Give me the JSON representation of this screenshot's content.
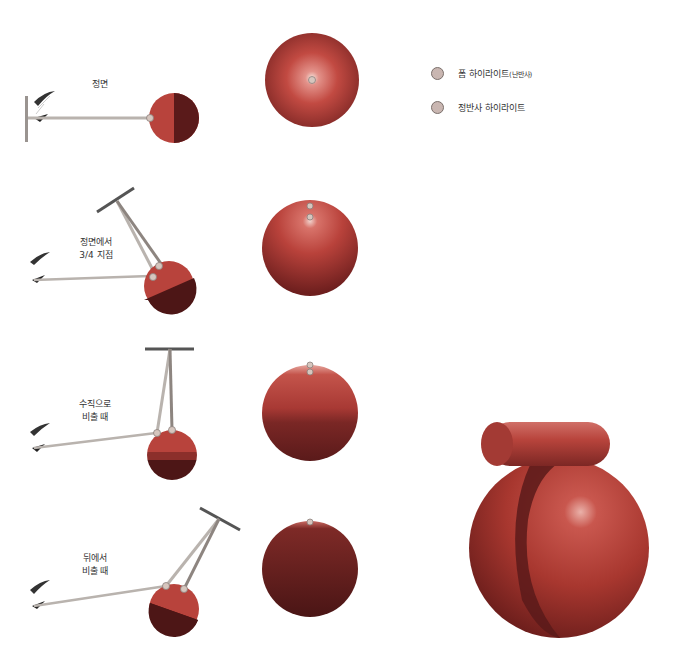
{
  "legend": {
    "items": [
      {
        "label": "폼 하이라이트",
        "suffix": "(난반사)",
        "marker_color": "#c9b6b1"
      },
      {
        "label": "정반사 하이라이트",
        "suffix": "",
        "marker_color": "#c9b6b1"
      }
    ]
  },
  "rows": [
    {
      "label_line1": "정면",
      "label_line2": ""
    },
    {
      "label_line1": "정면에서",
      "label_line2": "3/4 지점"
    },
    {
      "label_line1": "수직으로",
      "label_line2": "비출 때"
    },
    {
      "label_line1": "뒤에서",
      "label_line2": "비출 때"
    }
  ],
  "colors": {
    "sphere_base": "#b8433c",
    "sphere_shadow": "#6e1f1e",
    "sphere_lit": "#c75a50",
    "line": "#b9b3ae",
    "marker": "#d6c6be"
  }
}
